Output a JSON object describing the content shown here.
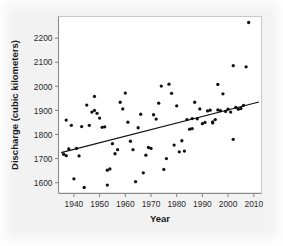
{
  "chart_data": {
    "type": "scatter",
    "title": "",
    "xlabel": "Year",
    "ylabel": "Discharge (cubic kilometers)",
    "xlim": [
      1934,
      2013
    ],
    "ylim": [
      1555,
      2290
    ],
    "grid": false,
    "legend": "none",
    "xticks": [
      1940,
      1950,
      1960,
      1970,
      1980,
      1990,
      2000,
      2010
    ],
    "yticks": [
      1600,
      1700,
      1800,
      1900,
      2000,
      2100,
      2200
    ],
    "point_color": "#111111",
    "line_color": "#111111",
    "marker": "filled-circle",
    "series": [
      {
        "name": "Annual discharge",
        "x": [
          1936,
          1937,
          1937,
          1938,
          1939,
          1940,
          1941,
          1942,
          1943,
          1944,
          1945,
          1946,
          1947,
          1948,
          1948,
          1949,
          1950,
          1951,
          1952,
          1953,
          1953,
          1954,
          1955,
          1956,
          1957,
          1958,
          1959,
          1960,
          1961,
          1962,
          1963,
          1964,
          1965,
          1966,
          1967,
          1968,
          1969,
          1970,
          1971,
          1972,
          1973,
          1974,
          1975,
          1976,
          1977,
          1978,
          1979,
          1980,
          1981,
          1982,
          1983,
          1984,
          1985,
          1986,
          1986,
          1987,
          1988,
          1989,
          1990,
          1991,
          1992,
          1993,
          1994,
          1994,
          1995,
          1996,
          1996,
          1997,
          1998,
          1999,
          2000,
          2001,
          2002,
          2002,
          2003,
          2004,
          2005,
          2006,
          2007,
          2008
        ],
        "y": [
          1718,
          1712,
          1860,
          1740,
          1838,
          1616,
          1742,
          1711,
          1833,
          1580,
          1922,
          1838,
          1893,
          1900,
          1958,
          1888,
          1868,
          1830,
          1832,
          1652,
          1590,
          1657,
          1762,
          1720,
          1737,
          1934,
          1906,
          1972,
          1851,
          1772,
          1737,
          1604,
          1828,
          1884,
          1641,
          1714,
          1746,
          1742,
          1882,
          1864,
          1930,
          2001,
          1655,
          1700,
          2009,
          1971,
          1756,
          1919,
          1728,
          1774,
          1731,
          1862,
          1822,
          1824,
          1866,
          1934,
          1865,
          1906,
          1845,
          1850,
          1898,
          1901,
          1852,
          1848,
          1862,
          2008,
          1902,
          1899,
          1969,
          1896,
          1905,
          1893,
          2086,
          1780,
          1913,
          1905,
          1908,
          1921,
          2081,
          2265
        ]
      }
    ],
    "trendline": {
      "name": "fitted regression line",
      "x": [
        1935,
        2012
      ],
      "y": [
        1725,
        1935
      ]
    }
  }
}
